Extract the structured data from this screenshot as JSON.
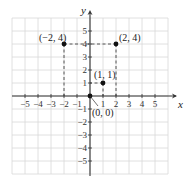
{
  "chart_data": {
    "type": "scatter",
    "title": "",
    "xlabel": "x",
    "ylabel": "y",
    "xlim": [
      -6,
      6
    ],
    "ylim": [
      -6,
      6
    ],
    "grid": true,
    "x_ticks": [
      -5,
      -4,
      -3,
      -2,
      -1,
      1,
      2,
      3,
      4,
      5
    ],
    "y_ticks": [
      -5,
      -4,
      -3,
      -2,
      -1,
      1,
      2,
      3,
      4,
      5
    ],
    "points": [
      {
        "x": -2,
        "y": 4,
        "label": "(−2, 4)"
      },
      {
        "x": 2,
        "y": 4,
        "label": "(2, 4)"
      },
      {
        "x": 1,
        "y": 1,
        "label": "(1, 1)"
      },
      {
        "x": 0,
        "y": 0,
        "label": "(0, 0)"
      }
    ],
    "dashed_guides": [
      {
        "from": [
          -2,
          4
        ],
        "to": [
          2,
          4
        ]
      },
      {
        "from": [
          -2,
          4
        ],
        "to": [
          -2,
          0
        ]
      },
      {
        "from": [
          2,
          4
        ],
        "to": [
          2,
          0
        ]
      },
      {
        "from": [
          1,
          1
        ],
        "to": [
          0,
          1
        ]
      },
      {
        "from": [
          1,
          1
        ],
        "to": [
          1,
          0
        ]
      }
    ]
  },
  "colors": {
    "grid": "#d8d8d8",
    "axis": "#333333",
    "point": "#111111",
    "guide": "#444444"
  }
}
